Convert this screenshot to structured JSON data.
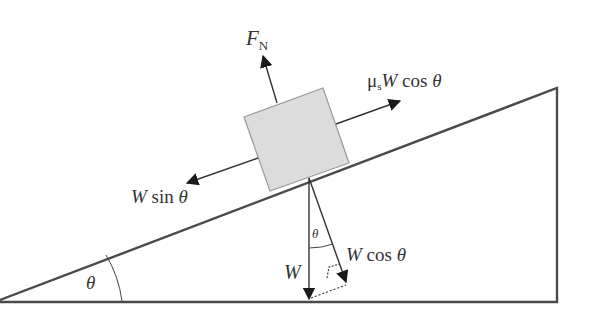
{
  "diagram": {
    "type": "free-body diagram of block on inclined plane",
    "colors": {
      "line": "#4a4a4a",
      "block_fill": "#dcdcdc",
      "block_edge": "#9a9a9a",
      "background": "#ffffff"
    },
    "labels": {
      "normal_force": {
        "main": "F",
        "sub": "N"
      },
      "friction": {
        "coef": "μ",
        "coef_sub": "s",
        "var": "W",
        "func": " cos ",
        "angle": "θ"
      },
      "parallel": {
        "var": "W",
        "func": " sin ",
        "angle": "θ"
      },
      "weight": {
        "var": "W"
      },
      "perpendicular": {
        "var": "W",
        "func": " cos ",
        "angle": "θ"
      },
      "incline_angle": "θ",
      "inner_angle": "θ"
    }
  }
}
